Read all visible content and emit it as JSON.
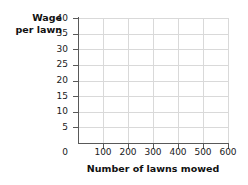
{
  "chart_data": {
    "type": "scatter",
    "title": "",
    "subtitle": "",
    "xlabel": "Number of lawns mowed",
    "ylabel_line1": "Wage",
    "ylabel_line2": "per lawn",
    "ylabel": "Wage per lawn",
    "x": [],
    "values": [],
    "series": [],
    "xlim": [
      0,
      600
    ],
    "ylim": [
      0,
      40
    ],
    "x_ticks": [
      0,
      100,
      200,
      300,
      400,
      500,
      600
    ],
    "x_tick_labels": [
      "0",
      "100",
      "200",
      "300",
      "400",
      "500",
      "600"
    ],
    "y_ticks": [
      5,
      10,
      15,
      20,
      25,
      30,
      35,
      40
    ],
    "y_tick_labels": [
      "5",
      "10",
      "15",
      "20",
      "25",
      "30",
      "35",
      "40"
    ],
    "y_origin_label": "0",
    "grid": true,
    "grid_color": "#d9d9d9",
    "axis_color": "#595959",
    "text_color": "#1a1a1a",
    "background": "#ffffff",
    "legend": [],
    "legend_position": "none",
    "annotations": [],
    "note": "empty plot grid, no data plotted"
  }
}
